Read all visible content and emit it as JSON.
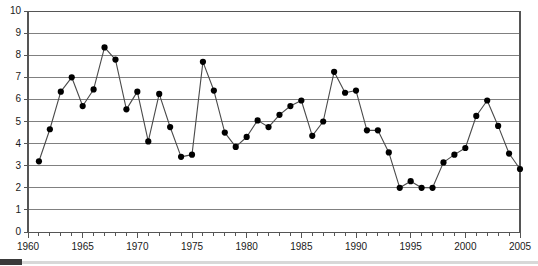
{
  "chart_data": {
    "type": "line",
    "title": "",
    "subtitle": "",
    "xlabel": "",
    "ylabel": "",
    "xlim": [
      1960,
      2005
    ],
    "ylim": [
      0,
      10
    ],
    "grid": true,
    "legend": false,
    "legend_position": "none",
    "marker": "filled-circle",
    "line_color": "#404040",
    "marker_color": "#000000",
    "y_ticks": [
      0,
      1,
      2,
      3,
      4,
      5,
      6,
      7,
      8,
      9,
      10
    ],
    "y_tick_labels": [
      "0",
      "1",
      "2",
      "3",
      "4",
      "5",
      "6",
      "7",
      "8",
      "9",
      "10"
    ],
    "x_tick_labels": [
      "1960",
      "1965",
      "1970",
      "1975",
      "1980",
      "1985",
      "1990",
      "1995",
      "2000",
      "2005"
    ],
    "x_tick_label_values": [
      1960,
      1965,
      1970,
      1975,
      1980,
      1985,
      1990,
      1995,
      2000,
      2005
    ],
    "x_minor_ticks_every": 1,
    "x": [
      1961,
      1962,
      1963,
      1964,
      1965,
      1966,
      1967,
      1968,
      1969,
      1970,
      1971,
      1972,
      1973,
      1974,
      1975,
      1976,
      1977,
      1978,
      1979,
      1980,
      1981,
      1982,
      1983,
      1984,
      1985,
      1986,
      1987,
      1988,
      1989,
      1990,
      1991,
      1992,
      1993,
      1994,
      1995,
      1996,
      1997,
      1998,
      1999,
      2000,
      2001,
      2002,
      2003,
      2004,
      2005
    ],
    "values": [
      3.2,
      4.65,
      6.35,
      7.0,
      5.7,
      6.45,
      8.35,
      7.8,
      5.55,
      6.35,
      4.1,
      6.25,
      4.75,
      3.4,
      3.5,
      7.7,
      6.4,
      4.5,
      3.85,
      4.3,
      5.05,
      4.75,
      5.3,
      5.7,
      5.95,
      4.35,
      5.0,
      7.25,
      6.3,
      6.4,
      4.6,
      4.6,
      3.6,
      2.0,
      2.3,
      2.0,
      2.0,
      3.15,
      3.5,
      3.8,
      5.25,
      5.95,
      4.8,
      3.55,
      2.85
    ],
    "series": [
      {
        "name": "series-1",
        "values": [
          3.2,
          4.65,
          6.35,
          7.0,
          5.7,
          6.45,
          8.35,
          7.8,
          5.55,
          6.35,
          4.1,
          6.25,
          4.75,
          3.4,
          3.5,
          7.7,
          6.4,
          4.5,
          3.85,
          4.3,
          5.05,
          4.75,
          5.3,
          5.7,
          5.95,
          4.35,
          5.0,
          7.25,
          6.3,
          6.4,
          4.6,
          4.6,
          3.6,
          2.0,
          2.3,
          2.0,
          2.0,
          3.15,
          3.5,
          3.8,
          5.25,
          5.95,
          4.8,
          3.55,
          2.85
        ]
      }
    ]
  },
  "colors": {
    "axis": "#555555",
    "grid": "#808080",
    "line": "#4a4a4a",
    "marker": "#000000",
    "text": "#1a1a1a",
    "background": "#ffffff",
    "footer_rule": "#d8d8d8",
    "footer_tab": "#3a3a3a"
  }
}
